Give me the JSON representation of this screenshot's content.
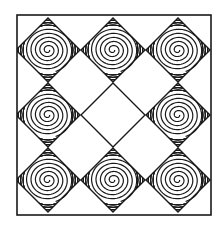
{
  "artwork": {
    "description": "Black and white line-art tile pattern: square frame containing a 3x3 grid of diamonds with concentric spiral motifs, alternating with empty diamonds",
    "stroke_color": "#1a1a1a",
    "background_color": "#ffffff",
    "frame": {
      "x": 17,
      "y": 15,
      "width": 194,
      "height": 200
    },
    "spiral_diamonds": [
      {
        "cx": 48,
        "cy": 50
      },
      {
        "cx": 113,
        "cy": 50
      },
      {
        "cx": 178,
        "cy": 50
      },
      {
        "cx": 48,
        "cy": 115
      },
      {
        "cx": 178,
        "cy": 115
      },
      {
        "cx": 48,
        "cy": 180
      },
      {
        "cx": 113,
        "cy": 180
      },
      {
        "cx": 178,
        "cy": 180
      }
    ],
    "empty_diamonds": [
      {
        "cx": 113,
        "cy": 115
      }
    ],
    "diamond_half_size": 32
  }
}
